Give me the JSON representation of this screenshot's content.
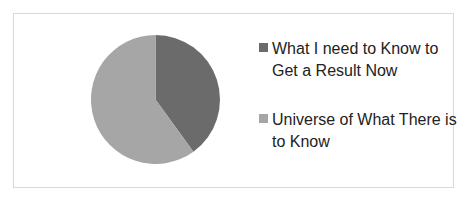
{
  "chart_data": {
    "type": "pie",
    "title": "",
    "categories": [
      "What I need to Know to Get a Result Now",
      "Universe of What There is to Know"
    ],
    "values": [
      40,
      60
    ],
    "colors": [
      "#6b6b6b",
      "#a6a6a6"
    ],
    "legend_position": "right",
    "start_angle_deg": 0,
    "direction": "clockwise"
  },
  "legend": {
    "items": [
      {
        "label": "What I need to Know to Get a Result Now",
        "color": "#6b6b6b"
      },
      {
        "label": "Universe of What There is to Know",
        "color": "#a6a6a6"
      }
    ]
  }
}
